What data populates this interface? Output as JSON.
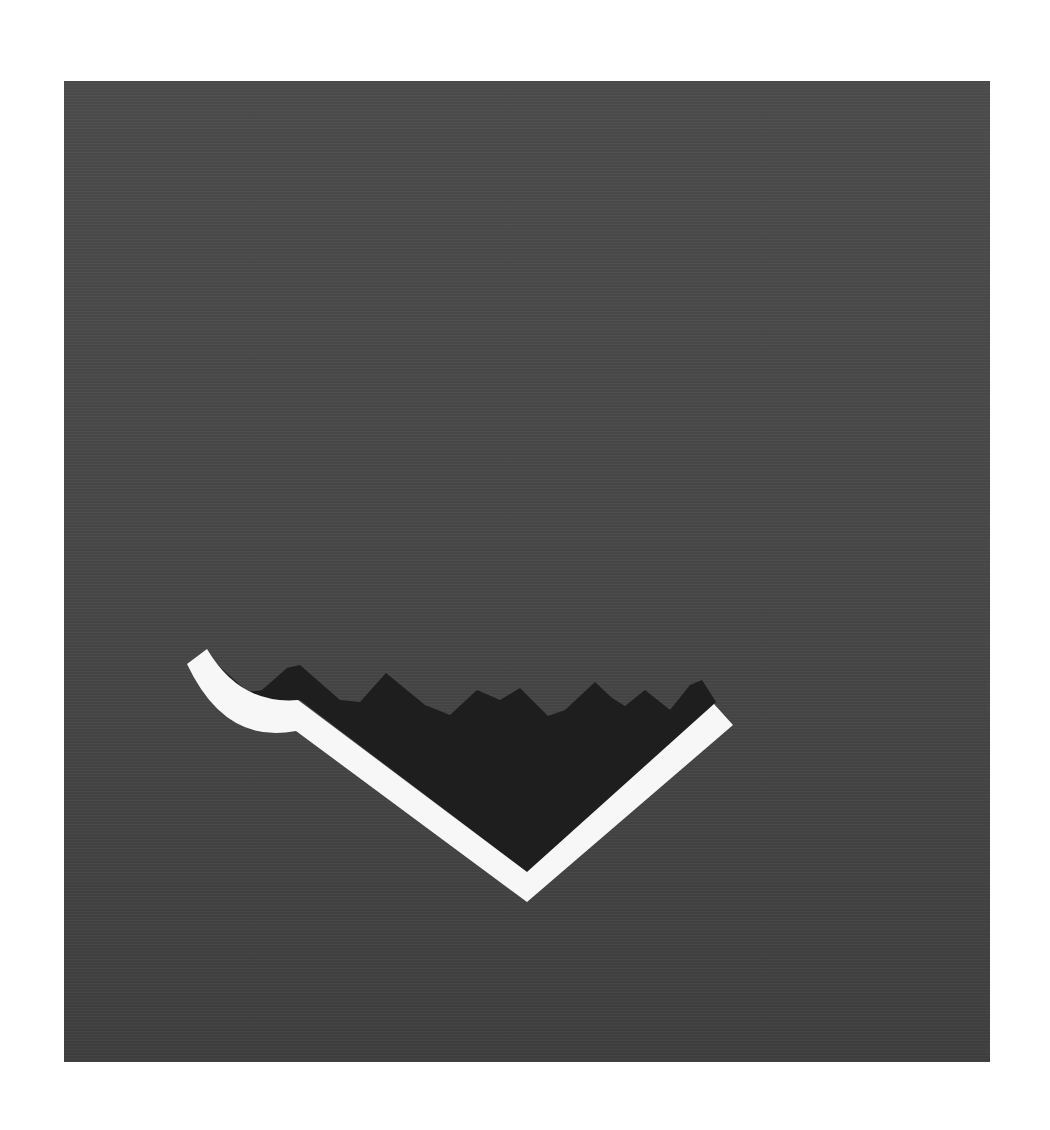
{
  "artwork": {
    "description": "Abstract graphic: dark gray square panel with a white hooked V-shaped band cradling a black jagged mountain-like shape",
    "colors": {
      "page_background": "#ffffff",
      "panel": "#484848",
      "dark_shape": "#1e1e1e",
      "band": "#f7f7f7"
    },
    "panel_bounds": {
      "x": 64,
      "y": 81,
      "width": 926,
      "height": 981
    }
  }
}
